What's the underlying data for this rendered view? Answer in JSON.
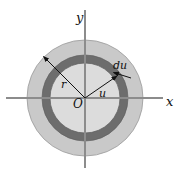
{
  "figure": {
    "background_color": "#ffffff",
    "colors": {
      "outer_disk": "#c9c9c9",
      "inner_disk": "#d8d8d8",
      "ring": "#6f6f6f",
      "axis": "#808080",
      "curve_outline": "#8a8a8a",
      "label": "#111111",
      "leader_line": "#1a1a1a"
    },
    "geometry": {
      "center_x": 85,
      "center_y": 98,
      "outer_radius": 58,
      "ring_outer_radius": 43,
      "ring_inner_radius": 35
    },
    "axes": {
      "y_axis_label": "y",
      "x_axis_label": "x",
      "origin_label": "O"
    },
    "annotations": [
      {
        "id": "radius-r",
        "label": "r",
        "x": 62,
        "y": 88
      },
      {
        "id": "radius-u",
        "label": "u",
        "x": 101,
        "y": 96
      },
      {
        "id": "thickness-du",
        "label": "du",
        "x": 116,
        "y": 70
      }
    ]
  }
}
